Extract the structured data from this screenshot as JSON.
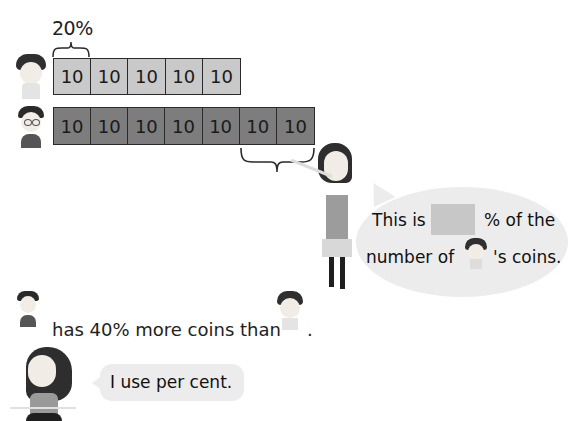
{
  "diagram": {
    "percent_label": "20%",
    "top_bar": {
      "owner": "curly-haired boy",
      "color": "#c9c9c9",
      "cells": [
        "10",
        "10",
        "10",
        "10",
        "10"
      ]
    },
    "bottom_bar": {
      "owner": "boy with glasses",
      "color": "#7d7d7d",
      "cells": [
        "10",
        "10",
        "10",
        "10",
        "10",
        "10",
        "10"
      ]
    },
    "big_bubble": {
      "line1_before": "This is",
      "line1_after": "% of the",
      "line2_before": "number of",
      "line2_after": "'s coins."
    },
    "statement": {
      "text": "has 40% more coins than",
      "end": "."
    },
    "small_bubble": {
      "text": "I use per cent."
    }
  }
}
